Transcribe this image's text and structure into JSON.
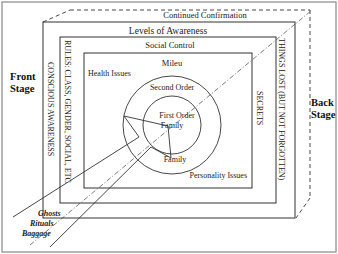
{
  "diagram": {
    "side_labels": {
      "front_line1": "Front",
      "front_line2": "Stage",
      "back_line1": "Back",
      "back_line2": "Stage"
    },
    "layers": {
      "outer_dashed": "Continued Confirmation",
      "box1": "Levels of Awareness",
      "box2": "Social Control",
      "box3": "Mileu",
      "outer_circle": "Second Order",
      "inner_circle_line1": "First Order",
      "inner_circle_line2": "Family",
      "lower_circle": "Family"
    },
    "corner_labels": {
      "health": "Health Issues",
      "personality": "Personality Issues"
    },
    "vertical_labels": {
      "left_outer": "CONSCIOUS AWARENESS",
      "left_inner": "RULES: CLASS, GENDER, SOCIAL, ETC",
      "right_outer": "THINGS LOST (BUT NOT FORGOTTEN)",
      "right_inner": "SECRETS"
    },
    "funnel_labels": [
      "Ghosts",
      "Rituals",
      "Baggage"
    ],
    "colors": {
      "line": "#333333",
      "frame": "#999999",
      "background": "#ffffff"
    }
  }
}
